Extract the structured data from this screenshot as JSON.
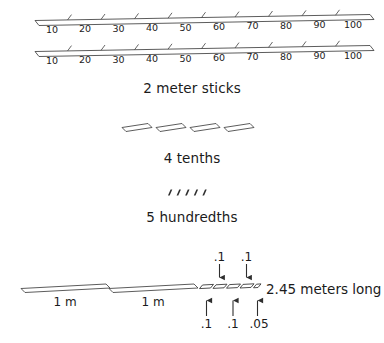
{
  "figure": {
    "title_visible": false,
    "stroke_color": "#3a3a3a",
    "text_color": "#1b1b1b",
    "background": "#ffffff"
  },
  "meter_sticks": {
    "caption": "2 meter sticks",
    "count": 2,
    "tick_labels": [
      "10",
      "20",
      "30",
      "40",
      "50",
      "60",
      "70",
      "80",
      "90",
      "100"
    ],
    "stick_1": {
      "name": "meter-stick-top",
      "tick_labels": [
        "10",
        "20",
        "30",
        "40",
        "50",
        "60",
        "70",
        "80",
        "90",
        "100"
      ]
    },
    "stick_2": {
      "name": "meter-stick-bottom",
      "tick_labels": [
        "10",
        "20",
        "30",
        "40",
        "50",
        "60",
        "70",
        "80",
        "90",
        "100"
      ]
    }
  },
  "tenths": {
    "caption": "4 tenths",
    "count": 4,
    "value_each": ".1"
  },
  "hundredths": {
    "caption": "5 hundredths",
    "count": 5,
    "value_each": ".01"
  },
  "measurement": {
    "result_text": "2.45 meters long",
    "meter_bars": [
      {
        "label": "1 m"
      },
      {
        "label": "1 m"
      }
    ],
    "tenth_blocks_count": 5,
    "arrows_above": [
      {
        "label": ".1"
      },
      {
        "label": ".1"
      }
    ],
    "arrows_below": [
      {
        "label": ".1"
      },
      {
        "label": ".1"
      },
      {
        "label": ".05"
      }
    ]
  }
}
